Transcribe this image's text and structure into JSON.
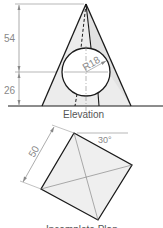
{
  "elevation": {
    "title": "Elevation",
    "dimensions": {
      "height_upper": "54",
      "height_lower": "26",
      "sphere_radius": "R18"
    }
  },
  "plan": {
    "title": "Incomplete Plan",
    "dimensions": {
      "side": "50",
      "angle": "30°"
    }
  },
  "colors": {
    "outline": "#1a1a1a",
    "thin": "#888888",
    "fill": "#eeeeee"
  }
}
